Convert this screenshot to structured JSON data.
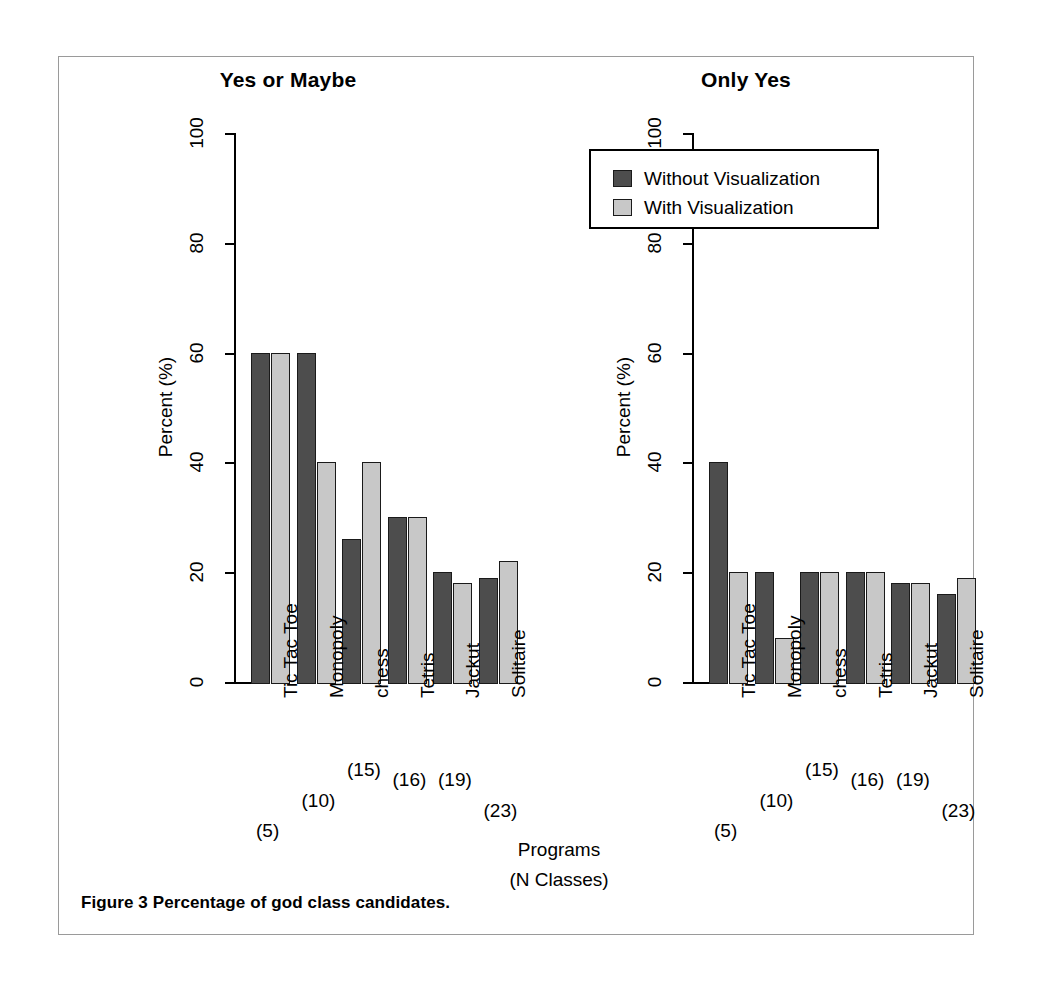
{
  "caption": "Figure 3 Percentage of god class candidates.",
  "axis": {
    "ylabel": "Percent  (%)",
    "xlabel_line1": "Programs",
    "xlabel_line2": "(N Classes)",
    "yticks": [
      "0",
      "20",
      "40",
      "60",
      "80",
      "100"
    ]
  },
  "legend": {
    "items": [
      {
        "label": "Without Visualization",
        "color": "#4d4d4d",
        "swatch": "dark"
      },
      {
        "label": "With Visualization",
        "color": "#c8c8c8",
        "swatch": "light"
      }
    ]
  },
  "categories": [
    {
      "name": "Tic Tac Toe",
      "count": "(5)"
    },
    {
      "name": "Monopoly",
      "count": "(10)"
    },
    {
      "name": "chess",
      "count": "(15)"
    },
    {
      "name": "Tetris",
      "count": "(16)"
    },
    {
      "name": "Jackut",
      "count": "(19)"
    },
    {
      "name": "Solitaire",
      "count": "(23)"
    }
  ],
  "chart_data": [
    {
      "type": "bar",
      "title": "Yes or Maybe",
      "xlabel": "Programs (N Classes)",
      "ylabel": "Percent  (%)",
      "ylim": [
        0,
        100
      ],
      "yticks": [
        0,
        20,
        40,
        60,
        80,
        100
      ],
      "grid": false,
      "legend_position": "none",
      "categories": [
        "Tic Tac Toe (5)",
        "Monopoly (10)",
        "chess (15)",
        "Tetris (16)",
        "Jackut (19)",
        "Solitaire (23)"
      ],
      "series": [
        {
          "name": "Without Visualization",
          "color": "#4d4d4d",
          "values": [
            60,
            60,
            26,
            30,
            20,
            19
          ]
        },
        {
          "name": "With Visualization",
          "color": "#c8c8c8",
          "values": [
            60,
            40,
            40,
            30,
            18,
            22
          ]
        }
      ]
    },
    {
      "type": "bar",
      "title": "Only Yes",
      "xlabel": "Programs (N Classes)",
      "ylabel": "Percent  (%)",
      "ylim": [
        0,
        100
      ],
      "yticks": [
        0,
        20,
        40,
        60,
        80,
        100
      ],
      "grid": false,
      "legend_position": "top-right",
      "categories": [
        "Tic Tac Toe (5)",
        "Monopoly (10)",
        "chess (15)",
        "Tetris (16)",
        "Jackut (19)",
        "Solitaire (23)"
      ],
      "series": [
        {
          "name": "Without Visualization",
          "color": "#4d4d4d",
          "values": [
            40,
            20,
            20,
            20,
            18,
            16
          ]
        },
        {
          "name": "With Visualization",
          "color": "#c8c8c8",
          "values": [
            20,
            8,
            20,
            20,
            18,
            19
          ]
        }
      ]
    }
  ]
}
